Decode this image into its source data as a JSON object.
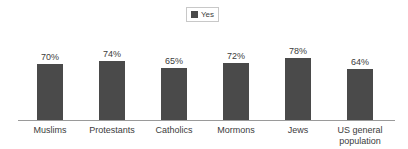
{
  "legend": {
    "entries": [
      {
        "label": "Yes",
        "color": "#4a4a4a",
        "swatch_icon": "square-swatch-icon"
      }
    ],
    "position": "top-center",
    "border_color": "#c8c8c8"
  },
  "axis": {
    "baseline_color": "#9a9a9a",
    "gridlines": false,
    "y_axis_visible": false
  },
  "chart_data": {
    "type": "bar",
    "title": "",
    "subtitle": "",
    "xlabel": "",
    "ylabel": "",
    "ylim": [
      0,
      100
    ],
    "grid": false,
    "legend_position": "top-center",
    "value_suffix": "%",
    "bar_color": "#4a4a4a",
    "categories": [
      "Muslims",
      "Protestants",
      "Catholics",
      "Mormons",
      "Jews",
      "US general population"
    ],
    "category_lines": [
      [
        "Muslims"
      ],
      [
        "Protestants"
      ],
      [
        "Catholics"
      ],
      [
        "Mormons"
      ],
      [
        "Jews"
      ],
      [
        "US general",
        "population"
      ]
    ],
    "series": [
      {
        "name": "Yes",
        "color": "#4a4a4a",
        "values": [
          70,
          74,
          65,
          72,
          78,
          64
        ],
        "value_labels": [
          "70%",
          "74%",
          "65%",
          "72%",
          "78%",
          "64%"
        ]
      }
    ]
  }
}
